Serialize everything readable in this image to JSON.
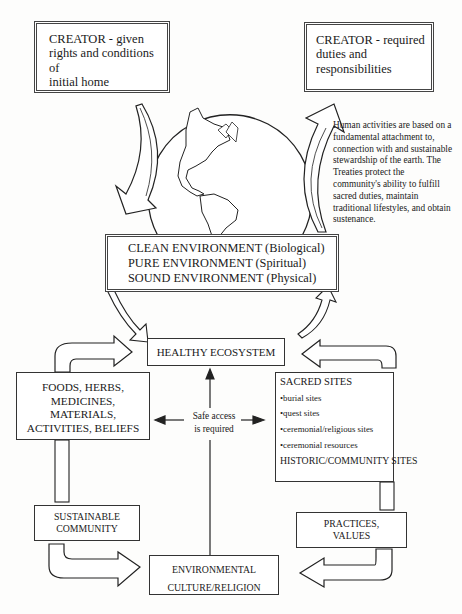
{
  "creator_left": {
    "lines": [
      "CREATOR - given",
      "rights and conditions of",
      "initial home"
    ]
  },
  "creator_right": {
    "lines": [
      "CREATOR - required",
      "duties and",
      "responsibilities"
    ]
  },
  "annotation": {
    "lines": [
      "Human activities are based on a",
      "fundamental attachment to,",
      "connection with and sustainable",
      "stewardship of the earth.  The",
      "Treaties protect the",
      "community's ability to fulfill",
      "sacred duties, maintain",
      "traditional lifestyles, and obtain",
      "sustenance."
    ]
  },
  "environment_box": {
    "lines": [
      "CLEAN ENVIRONMENT (Biological)",
      "PURE ENVIRONMENT (Spiritual)",
      "SOUND ENVIRONMENT (Physical)"
    ]
  },
  "healthy_ecosystem": {
    "label": "HEALTHY ECOSYSTEM"
  },
  "resources_box": {
    "lines": [
      "FOODS, HERBS,",
      "MEDICINES, MATERIALS,",
      "ACTIVITIES, BELIEFS"
    ]
  },
  "safe_access": {
    "lines": [
      "Safe access",
      "is required"
    ]
  },
  "sites_box": {
    "heading": "SACRED SITES",
    "items": [
      "•burial sites",
      "•quest sites",
      "•ceremonial/religious sites",
      "•ceremonial resources"
    ],
    "footer": "HISTORIC/COMMUNITY SITES"
  },
  "sustainable_community": {
    "lines": [
      "SUSTAINABLE",
      "COMMUNITY"
    ]
  },
  "practices_values": {
    "lines": [
      "PRACTICES,",
      "VALUES"
    ]
  },
  "culture_box": {
    "lines": [
      "ENVIRONMENTAL",
      "CULTURE/RELIGION"
    ]
  },
  "globe": {
    "icon": "globe-americas-icon"
  }
}
